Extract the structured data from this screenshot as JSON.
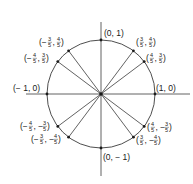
{
  "center": {
    "x": 101,
    "y": 94
  },
  "radius": 54,
  "colors": {
    "stroke": "#3a3a3a",
    "text": "#1a1a1a",
    "background": "#ffffff"
  },
  "axes": {
    "x": {
      "from": 26,
      "to": 190
    },
    "y": {
      "from": 22,
      "to": 176
    }
  },
  "points": [
    {
      "x": 0,
      "y": 1,
      "label": "(0, 1)"
    },
    {
      "x": 0.6,
      "y": 0.8,
      "label": "(3/5, 4/5)"
    },
    {
      "x": 0.8,
      "y": 0.6,
      "label": "(4/5, 3/5)"
    },
    {
      "x": 1,
      "y": 0,
      "label": "(1, 0)"
    },
    {
      "x": 0.8,
      "y": -0.6,
      "label": "(4/5, -3/5)"
    },
    {
      "x": 0.6,
      "y": -0.8,
      "label": "(3/5, -4/5)"
    },
    {
      "x": 0,
      "y": -1,
      "label": "(0, -1)"
    },
    {
      "x": -0.6,
      "y": -0.8,
      "label": "(-3/5, -4/5)"
    },
    {
      "x": -0.8,
      "y": -0.6,
      "label": "(-4/5, -3/5)"
    },
    {
      "x": -1,
      "y": 0,
      "label": "(-1, 0)"
    },
    {
      "x": -0.8,
      "y": 0.6,
      "label": "(-4/5, 3/5)"
    },
    {
      "x": -0.6,
      "y": 0.8,
      "label": "(-3/5, 4/5)"
    }
  ],
  "radii_drawn_to": [
    {
      "x": 0.6,
      "y": 0.8
    },
    {
      "x": 0.8,
      "y": 0.6
    },
    {
      "x": 0.8,
      "y": -0.6
    },
    {
      "x": 0.6,
      "y": -0.8
    },
    {
      "x": -0.6,
      "y": -0.8
    },
    {
      "x": -0.8,
      "y": -0.6
    },
    {
      "x": -0.8,
      "y": 0.6
    },
    {
      "x": -0.6,
      "y": 0.8
    }
  ],
  "labels": {
    "top": "(0, 1)",
    "bottom": "(0, − 1)",
    "right": "(1, 0)",
    "left": "(− 1, 0)",
    "q1a": {
      "pre": "(",
      "n1": "3",
      "d1": "5",
      "sep": ",",
      "n2": "4",
      "d2": "5",
      "post": ")"
    },
    "q1b": {
      "pre": "(",
      "n1": "4",
      "d1": "5",
      "sep": ",",
      "n2": "3",
      "d2": "5",
      "post": ")"
    },
    "q4a": {
      "pre": "(",
      "n1": "4",
      "d1": "5",
      "sep": ", −",
      "n2": "3",
      "d2": "5",
      "post": ")"
    },
    "q4b": {
      "pre": "(",
      "n1": "3",
      "d1": "5",
      "sep": ", −",
      "n2": "4",
      "d2": "5",
      "post": ")"
    },
    "q2a": {
      "pre": "(−",
      "n1": "3",
      "d1": "5",
      "sep": ",",
      "n2": "4",
      "d2": "5",
      "post": ")"
    },
    "q2b": {
      "pre": "(−",
      "n1": "4",
      "d1": "5",
      "sep": ",",
      "n2": "3",
      "d2": "5",
      "post": ")"
    },
    "q3a": {
      "pre": "(−",
      "n1": "4",
      "d1": "5",
      "sep": ", −",
      "n2": "3",
      "d2": "5",
      "post": ")"
    },
    "q3b": {
      "pre": "(−",
      "n1": "3",
      "d1": "5",
      "sep": ", −",
      "n2": "4",
      "d2": "5",
      "post": ")"
    }
  }
}
